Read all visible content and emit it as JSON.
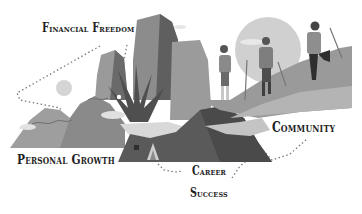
{
  "illustration": {
    "description": "Hikers climbing mountains with milestone labels",
    "palette": {
      "dark": "#4a4a4a",
      "mid": "#7a7a7a",
      "light": "#a8a8a8",
      "pale": "#d2d2d2",
      "sun": "#cfcfcf",
      "ink": "#1e1e1e"
    }
  },
  "labels": {
    "financial_freedom": "Financial Freedom",
    "community": "Community",
    "personal_growth": "Personal Growth",
    "career_line1": "Career",
    "career_line2": "Success"
  }
}
